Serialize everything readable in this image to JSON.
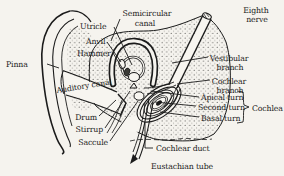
{
  "figure": {
    "paper_color": "#f5f3ee",
    "ink_color": "#1b1b1b",
    "labels": {
      "pinna": "Pinna",
      "utricle": "Utricle",
      "anvil": "Anvil",
      "hammer": "Hammer",
      "semicircular_canal_1": "Semicircular",
      "semicircular_canal_2": "canal",
      "eighth_nerve_1": "Eighth",
      "eighth_nerve_2": "nerve",
      "vestibular_branch_1": "Vestibular",
      "vestibular_branch_2": "branch",
      "cochlear_branch_1": "Cochlear",
      "cochlear_branch_2": "branch",
      "auditory_canal": "Auditory canal",
      "drum": "Drum",
      "stirrup": "Stirrup",
      "saccule": "Saccule",
      "apical_turn": "Apical turn",
      "second_turn": "Second turn",
      "basal_turn": "Basal turn",
      "cochlea": "Cochlea",
      "cochlear_duct": "Cochlear duct",
      "eustachian_tube": "Eustachian tube"
    }
  }
}
